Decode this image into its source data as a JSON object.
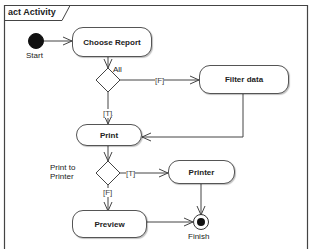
{
  "frame": {
    "label": "act Activity",
    "border_color": "#444444"
  },
  "nodes": {
    "start": {
      "label": "Start",
      "type": "initial"
    },
    "choose_report": {
      "label": "Choose Report",
      "type": "action"
    },
    "decision_all": {
      "label": "All",
      "type": "decision"
    },
    "filter_data": {
      "label": "Filter data",
      "type": "action"
    },
    "print": {
      "label": "Print",
      "type": "action"
    },
    "decision_print_to_printer": {
      "label_line1": "Print to",
      "label_line2": "Printer",
      "type": "decision"
    },
    "printer": {
      "label": "Printer",
      "type": "action"
    },
    "preview": {
      "label": "Preview",
      "type": "action"
    },
    "finish": {
      "label": "Finish",
      "type": "final"
    }
  },
  "edges": [
    {
      "from": "start",
      "to": "choose_report",
      "guard": ""
    },
    {
      "from": "choose_report",
      "to": "decision_all",
      "guard": ""
    },
    {
      "from": "decision_all",
      "to": "filter_data",
      "guard": "[F]"
    },
    {
      "from": "decision_all",
      "to": "print",
      "guard": "[T]"
    },
    {
      "from": "filter_data",
      "to": "print",
      "guard": ""
    },
    {
      "from": "print",
      "to": "decision_print_to_printer",
      "guard": ""
    },
    {
      "from": "decision_print_to_printer",
      "to": "printer",
      "guard": "[T]"
    },
    {
      "from": "decision_print_to_printer",
      "to": "preview",
      "guard": "[F]"
    },
    {
      "from": "printer",
      "to": "finish",
      "guard": ""
    },
    {
      "from": "preview",
      "to": "finish",
      "guard": ""
    }
  ]
}
